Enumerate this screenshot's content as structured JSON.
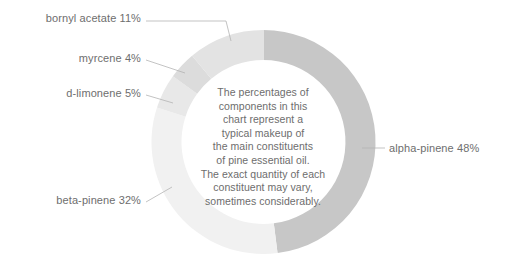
{
  "chart_data": {
    "type": "pie",
    "variant": "donut",
    "title": "",
    "subtitle": "",
    "xlabel": "",
    "ylabel": "",
    "grid": false,
    "legend_position": "callout-labels",
    "units": "percent",
    "start_angle_deg": 0,
    "direction": "clockwise",
    "center_note": "The percentages of components in this chart represent a typical makeup of the main constituents of pine essential oil. The exact quantity of each constituent may vary, sometimes considerably.",
    "categories": [
      "alpha-pinene",
      "beta-pinene",
      "bornyl acetate",
      "d-limonene",
      "myrcene"
    ],
    "values": [
      48,
      32,
      11,
      5,
      4
    ],
    "slices": [
      {
        "name": "alpha-pinene",
        "value": 48,
        "label": "alpha-pinene 48%",
        "color": "#c7c7c7",
        "start_deg": 0,
        "end_deg": 172.8
      },
      {
        "name": "beta-pinene",
        "value": 32,
        "label": "beta-pinene 32%",
        "color": "#f1f1f1",
        "start_deg": 172.8,
        "end_deg": 288.0
      },
      {
        "name": "d-limonene",
        "value": 5,
        "label": "d-limonene 5%",
        "color": "#e8e8e8",
        "start_deg": 288.0,
        "end_deg": 306.0
      },
      {
        "name": "myrcene",
        "value": 4,
        "label": "myrcene 4%",
        "color": "#dcdcdc",
        "start_deg": 306.0,
        "end_deg": 320.4
      },
      {
        "name": "bornyl acetate",
        "value": 11,
        "label": "bornyl acetate 11%",
        "color": "#e3e3e3",
        "start_deg": 320.4,
        "end_deg": 360.0
      }
    ]
  },
  "labels": {
    "bornyl_acetate": "bornyl acetate 11%",
    "myrcene": "myrcene 4%",
    "d_limonene": "d-limonene 5%",
    "beta_pinene": "beta-pinene 32%",
    "alpha_pinene": "alpha-pinene 48%"
  },
  "center_note_lines": [
    "The percentages of",
    "components in this",
    "chart represent a",
    "typical makeup of",
    "the main constituents",
    "of pine essential oil.",
    "The exact quantity of each",
    "constituent may vary,",
    "sometimes considerably."
  ],
  "colors": {
    "background": "#ffffff",
    "text": "#6e6e6e",
    "center_text": "#6d6d6d",
    "leader_line": "#b4b4b4",
    "alpha_pinene": "#c7c7c7",
    "beta_pinene": "#f1f1f1",
    "bornyl_acetate": "#e3e3e3",
    "d_limonene": "#e8e8e8",
    "myrcene": "#dcdcdc"
  }
}
